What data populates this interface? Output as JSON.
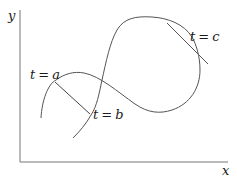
{
  "diagram": {
    "axes": {
      "x_label": "x",
      "y_label": "y",
      "color": "#666666"
    },
    "curve": {
      "color": "#555555",
      "description": "parametric curve with self-intersecting loop"
    },
    "points": [
      {
        "param": "t",
        "eq": "=",
        "value": "a"
      },
      {
        "param": "t",
        "eq": "=",
        "value": "b"
      },
      {
        "param": "t",
        "eq": "=",
        "value": "c"
      }
    ],
    "chord": {
      "from": "t = a",
      "to": "t = b"
    },
    "tangent": {
      "at": "t = c"
    }
  }
}
